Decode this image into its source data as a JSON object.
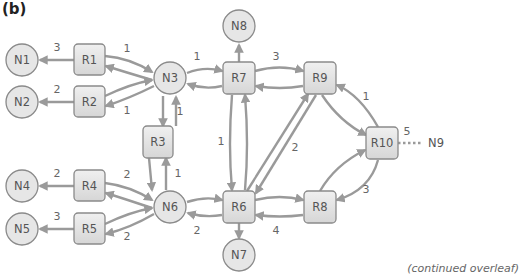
{
  "panel_label": "(b)",
  "footer_note": "(continued overleaf)",
  "colors": {
    "edge": "#9a9a9a",
    "node_fill": "#e6e6e6",
    "node_stroke": "#8a8a8a",
    "text": "#555555"
  },
  "nodes": {
    "N1": "N1",
    "N2": "N2",
    "N3": "N3",
    "N4": "N4",
    "N5": "N5",
    "N6": "N6",
    "N7": "N7",
    "N8": "N8",
    "N9": "N9",
    "R1": "R1",
    "R2": "R2",
    "R3": "R3",
    "R4": "R4",
    "R5": "R5",
    "R6": "R6",
    "R7": "R7",
    "R8": "R8",
    "R9": "R9",
    "R10": "R10"
  },
  "weights": {
    "r1_n1": "3",
    "r2_n2": "2",
    "r1_n3": "1",
    "n3_r2": "1",
    "n3_r7": "1",
    "r7_r9": "3",
    "n3_r3": "1",
    "r3_n6": "1",
    "r7_r6": "1",
    "r6_r9": "2",
    "r9_r10": "1",
    "r10_n9": "5",
    "r8_r10": "3",
    "r4_n4": "2",
    "r4_n6": "2",
    "r5_n5": "3",
    "n6_r5": "2",
    "n6_r6": "2",
    "r6_r8": "4"
  },
  "edges": [
    {
      "from": "R1",
      "to": "N1",
      "weight": "3"
    },
    {
      "from": "R2",
      "to": "N2",
      "weight": "2"
    },
    {
      "from": "R1",
      "to": "N3",
      "weight": "1",
      "bidirectional": true
    },
    {
      "from": "R2",
      "to": "N3",
      "weight": "1",
      "bidirectional": true
    },
    {
      "from": "N3",
      "to": "R7",
      "weight": "1",
      "bidirectional": true
    },
    {
      "from": "R7",
      "to": "N8"
    },
    {
      "from": "R7",
      "to": "R9",
      "weight": "3",
      "bidirectional": true
    },
    {
      "from": "N3",
      "to": "R3",
      "weight": "1",
      "bidirectional": true
    },
    {
      "from": "R3",
      "to": "N6",
      "weight": "1",
      "bidirectional": true
    },
    {
      "from": "R7",
      "to": "R6",
      "weight": "1",
      "bidirectional": true
    },
    {
      "from": "R6",
      "to": "R9",
      "weight": "2",
      "bidirectional": true
    },
    {
      "from": "R9",
      "to": "R10",
      "weight": "1",
      "bidirectional": true
    },
    {
      "from": "R10",
      "to": "N9",
      "weight": "5",
      "style": "dotted"
    },
    {
      "from": "R8",
      "to": "R10",
      "weight": "3",
      "bidirectional": true
    },
    {
      "from": "R4",
      "to": "N4",
      "weight": "2"
    },
    {
      "from": "R5",
      "to": "N5",
      "weight": "3"
    },
    {
      "from": "R4",
      "to": "N6",
      "weight": "2",
      "bidirectional": true
    },
    {
      "from": "R5",
      "to": "N6",
      "weight": "2",
      "bidirectional": true
    },
    {
      "from": "N6",
      "to": "R6",
      "weight": "2",
      "bidirectional": true
    },
    {
      "from": "R6",
      "to": "R8",
      "weight": "4",
      "bidirectional": true
    },
    {
      "from": "R6",
      "to": "N7"
    }
  ]
}
